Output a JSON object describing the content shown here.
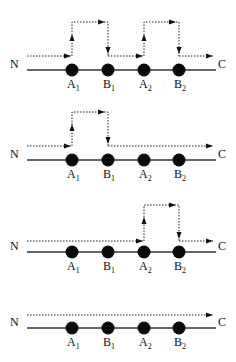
{
  "diagram": {
    "start_label": "N",
    "end_label": "C",
    "nodes": [
      {
        "id": "A1",
        "base": "A",
        "sub": "1",
        "x": 72
      },
      {
        "id": "B1",
        "base": "B",
        "sub": "1",
        "x": 108
      },
      {
        "id": "A2",
        "base": "A",
        "sub": "2",
        "x": 144
      },
      {
        "id": "B2",
        "base": "B",
        "sub": "2",
        "x": 179
      }
    ],
    "panels": [
      {
        "name": "panel-1",
        "track_y": 70,
        "low_y": 56,
        "high_y": 22,
        "bypass": [
          [
            "A1",
            "B1"
          ],
          [
            "A2",
            "B2"
          ]
        ]
      },
      {
        "name": "panel-2",
        "track_y": 160,
        "low_y": 146,
        "high_y": 112,
        "bypass": [
          [
            "A1",
            "B1"
          ]
        ]
      },
      {
        "name": "panel-3",
        "track_y": 252,
        "low_y": 241,
        "high_y": 205,
        "bypass": [
          [
            "A2",
            "B2"
          ]
        ]
      },
      {
        "name": "panel-4",
        "track_y": 328,
        "low_y": 315,
        "high_y": null,
        "bypass": []
      }
    ]
  }
}
